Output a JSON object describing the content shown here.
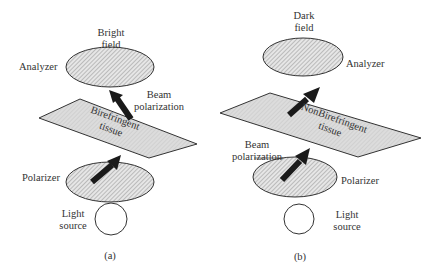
{
  "panels": [
    {
      "id": "a",
      "caption": "(a)",
      "top_label_line1": "Bright",
      "top_label_line2": "field",
      "analyzer_label": "Analyzer",
      "beam_label_line1": "Beam",
      "beam_label_line2": "polarization",
      "tissue_label_line1": "Birefringent",
      "tissue_label_line2": "tissue",
      "polarizer_label": "Polarizer",
      "source_label_line1": "Light",
      "source_label_line2": "source"
    },
    {
      "id": "b",
      "caption": "(b)",
      "top_label_line1": "Dark",
      "top_label_line2": "field",
      "analyzer_label": "Analyzer",
      "beam_label_line1": "Beam",
      "beam_label_line2": "polarization",
      "tissue_label_line1": "NonBirefringent",
      "tissue_label_line2": "tissue",
      "polarizer_label": "Polarizer",
      "source_label_line1": "Light",
      "source_label_line2": "source"
    }
  ],
  "colors": {
    "outline": "#333333",
    "hatch": "#9a9a9a",
    "tissue_fill": "#d8d8d8",
    "arrow": "#1a1a1a"
  }
}
